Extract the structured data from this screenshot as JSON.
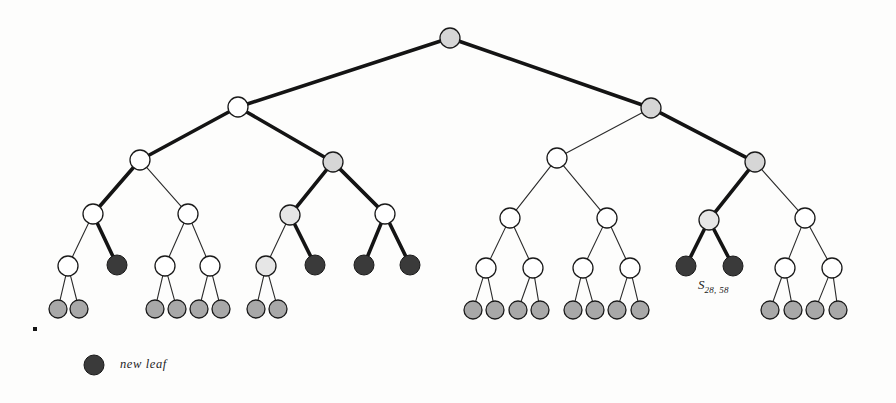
{
  "figure": {
    "background_color": "#fdfdfc",
    "colors": {
      "node_white_fill": "#ffffff",
      "node_gray_fill": "#d6d6d6",
      "node_lightgray_fill": "#e6e6e6",
      "node_dark_fill": "#3a3a3a",
      "node_leaf_fill": "#a8a8a8",
      "stroke": "#1a1a1a",
      "edge_thin": "#2b2b2b",
      "edge_thick": "#141414"
    }
  },
  "labels": {
    "node_label": {
      "base": "S",
      "subscript": "28, 58"
    },
    "legend_label": "new leaf"
  },
  "chart_data": {
    "type": "diagram",
    "diagram_kind": "binary-tree",
    "depth_levels": 6,
    "node_counts_by_level": [
      1,
      2,
      4,
      8,
      16,
      24
    ],
    "legend": [
      {
        "swatch": "dark",
        "label": "new leaf"
      }
    ],
    "annotations": [
      {
        "text": "S_{28, 58}",
        "x": 703,
        "y": 288
      }
    ],
    "nodes": [
      {
        "id": "root",
        "x": 450,
        "y": 38,
        "r": 10,
        "fill": "gray"
      },
      {
        "id": "L1a",
        "x": 238,
        "y": 107,
        "r": 10,
        "fill": "white"
      },
      {
        "id": "L1b",
        "x": 651,
        "y": 108,
        "r": 10,
        "fill": "gray"
      },
      {
        "id": "L2a",
        "x": 140,
        "y": 160,
        "r": 10,
        "fill": "white"
      },
      {
        "id": "L2b",
        "x": 333,
        "y": 162,
        "r": 10,
        "fill": "gray"
      },
      {
        "id": "L2c",
        "x": 557,
        "y": 158,
        "r": 10,
        "fill": "white"
      },
      {
        "id": "L2d",
        "x": 755,
        "y": 162,
        "r": 10,
        "fill": "gray"
      },
      {
        "id": "L3a",
        "x": 93,
        "y": 214,
        "r": 10,
        "fill": "white"
      },
      {
        "id": "L3b",
        "x": 188,
        "y": 214,
        "r": 10,
        "fill": "white"
      },
      {
        "id": "L3c",
        "x": 290,
        "y": 215,
        "r": 10,
        "fill": "lightgray"
      },
      {
        "id": "L3d",
        "x": 385,
        "y": 214,
        "r": 10,
        "fill": "white"
      },
      {
        "id": "L3e",
        "x": 510,
        "y": 218,
        "r": 10,
        "fill": "white"
      },
      {
        "id": "L3f",
        "x": 607,
        "y": 218,
        "r": 10,
        "fill": "white"
      },
      {
        "id": "L3g",
        "x": 709,
        "y": 220,
        "r": 10,
        "fill": "lightgray"
      },
      {
        "id": "L3h",
        "x": 805,
        "y": 218,
        "r": 10,
        "fill": "white"
      },
      {
        "id": "L4a",
        "x": 68,
        "y": 266,
        "r": 10,
        "fill": "white"
      },
      {
        "id": "L4b",
        "x": 117,
        "y": 265,
        "r": 10,
        "fill": "dark"
      },
      {
        "id": "L4c",
        "x": 165,
        "y": 266,
        "r": 10,
        "fill": "white"
      },
      {
        "id": "L4d",
        "x": 210,
        "y": 266,
        "r": 10,
        "fill": "white"
      },
      {
        "id": "L4e",
        "x": 266,
        "y": 266,
        "r": 10,
        "fill": "lightgray"
      },
      {
        "id": "L4f",
        "x": 315,
        "y": 265,
        "r": 10,
        "fill": "dark"
      },
      {
        "id": "L4g",
        "x": 364,
        "y": 265,
        "r": 10,
        "fill": "dark"
      },
      {
        "id": "L4h",
        "x": 410,
        "y": 265,
        "r": 10,
        "fill": "dark"
      },
      {
        "id": "L4i",
        "x": 486,
        "y": 268,
        "r": 10,
        "fill": "white"
      },
      {
        "id": "L4j",
        "x": 533,
        "y": 268,
        "r": 10,
        "fill": "white"
      },
      {
        "id": "L4k",
        "x": 583,
        "y": 268,
        "r": 10,
        "fill": "white"
      },
      {
        "id": "L4l",
        "x": 630,
        "y": 268,
        "r": 10,
        "fill": "white"
      },
      {
        "id": "L4m",
        "x": 686,
        "y": 266,
        "r": 10,
        "fill": "dark"
      },
      {
        "id": "L4n",
        "x": 733,
        "y": 266,
        "r": 10,
        "fill": "dark"
      },
      {
        "id": "L4o",
        "x": 785,
        "y": 268,
        "r": 10,
        "fill": "white"
      },
      {
        "id": "L4p",
        "x": 832,
        "y": 268,
        "r": 10,
        "fill": "white"
      },
      {
        "id": "F01",
        "x": 58,
        "y": 309,
        "r": 9,
        "fill": "leaf"
      },
      {
        "id": "F02",
        "x": 79,
        "y": 309,
        "r": 9,
        "fill": "leaf"
      },
      {
        "id": "F03",
        "x": 155,
        "y": 309,
        "r": 9,
        "fill": "leaf"
      },
      {
        "id": "F04",
        "x": 177,
        "y": 309,
        "r": 9,
        "fill": "leaf"
      },
      {
        "id": "F05",
        "x": 199,
        "y": 309,
        "r": 9,
        "fill": "leaf"
      },
      {
        "id": "F06",
        "x": 221,
        "y": 309,
        "r": 9,
        "fill": "leaf"
      },
      {
        "id": "F07",
        "x": 256,
        "y": 309,
        "r": 9,
        "fill": "leaf"
      },
      {
        "id": "F08",
        "x": 278,
        "y": 309,
        "r": 9,
        "fill": "leaf"
      },
      {
        "id": "F09",
        "x": 473,
        "y": 310,
        "r": 9,
        "fill": "leaf"
      },
      {
        "id": "F10",
        "x": 495,
        "y": 310,
        "r": 9,
        "fill": "leaf"
      },
      {
        "id": "F11",
        "x": 518,
        "y": 310,
        "r": 9,
        "fill": "leaf"
      },
      {
        "id": "F12",
        "x": 540,
        "y": 310,
        "r": 9,
        "fill": "leaf"
      },
      {
        "id": "F13",
        "x": 573,
        "y": 310,
        "r": 9,
        "fill": "leaf"
      },
      {
        "id": "F14",
        "x": 595,
        "y": 310,
        "r": 9,
        "fill": "leaf"
      },
      {
        "id": "F15",
        "x": 617,
        "y": 310,
        "r": 9,
        "fill": "leaf"
      },
      {
        "id": "F16",
        "x": 640,
        "y": 310,
        "r": 9,
        "fill": "leaf"
      },
      {
        "id": "F17",
        "x": 770,
        "y": 310,
        "r": 9,
        "fill": "leaf"
      },
      {
        "id": "F18",
        "x": 793,
        "y": 310,
        "r": 9,
        "fill": "leaf"
      },
      {
        "id": "F19",
        "x": 815,
        "y": 310,
        "r": 9,
        "fill": "leaf"
      },
      {
        "id": "F20",
        "x": 838,
        "y": 310,
        "r": 9,
        "fill": "leaf"
      },
      {
        "id": "LEG",
        "x": 94,
        "y": 365,
        "r": 10,
        "fill": "dark"
      }
    ],
    "edges": [
      {
        "from": "root",
        "to": "L1a",
        "weight": "thick"
      },
      {
        "from": "root",
        "to": "L1b",
        "weight": "thick"
      },
      {
        "from": "L1a",
        "to": "L2a",
        "weight": "thick"
      },
      {
        "from": "L1a",
        "to": "L2b",
        "weight": "thick"
      },
      {
        "from": "L1b",
        "to": "L2c",
        "weight": "thin"
      },
      {
        "from": "L1b",
        "to": "L2d",
        "weight": "thick"
      },
      {
        "from": "L2a",
        "to": "L3a",
        "weight": "thick"
      },
      {
        "from": "L2a",
        "to": "L3b",
        "weight": "thin"
      },
      {
        "from": "L2b",
        "to": "L3c",
        "weight": "thick"
      },
      {
        "from": "L2b",
        "to": "L3d",
        "weight": "thick"
      },
      {
        "from": "L2c",
        "to": "L3e",
        "weight": "thin"
      },
      {
        "from": "L2c",
        "to": "L3f",
        "weight": "thin"
      },
      {
        "from": "L2d",
        "to": "L3g",
        "weight": "thick"
      },
      {
        "from": "L2d",
        "to": "L3h",
        "weight": "thin"
      },
      {
        "from": "L3a",
        "to": "L4a",
        "weight": "thin"
      },
      {
        "from": "L3a",
        "to": "L4b",
        "weight": "thick"
      },
      {
        "from": "L3b",
        "to": "L4c",
        "weight": "thin"
      },
      {
        "from": "L3b",
        "to": "L4d",
        "weight": "thin"
      },
      {
        "from": "L3c",
        "to": "L4e",
        "weight": "thin"
      },
      {
        "from": "L3c",
        "to": "L4f",
        "weight": "thick"
      },
      {
        "from": "L3d",
        "to": "L4g",
        "weight": "thick"
      },
      {
        "from": "L3d",
        "to": "L4h",
        "weight": "thick"
      },
      {
        "from": "L3e",
        "to": "L4i",
        "weight": "thin"
      },
      {
        "from": "L3e",
        "to": "L4j",
        "weight": "thin"
      },
      {
        "from": "L3f",
        "to": "L4k",
        "weight": "thin"
      },
      {
        "from": "L3f",
        "to": "L4l",
        "weight": "thin"
      },
      {
        "from": "L3g",
        "to": "L4m",
        "weight": "thick"
      },
      {
        "from": "L3g",
        "to": "L4n",
        "weight": "thick"
      },
      {
        "from": "L3h",
        "to": "L4o",
        "weight": "thin"
      },
      {
        "from": "L3h",
        "to": "L4p",
        "weight": "thin"
      },
      {
        "from": "L4a",
        "to": "F01",
        "weight": "thin"
      },
      {
        "from": "L4a",
        "to": "F02",
        "weight": "thin"
      },
      {
        "from": "L4c",
        "to": "F03",
        "weight": "thin"
      },
      {
        "from": "L4c",
        "to": "F04",
        "weight": "thin"
      },
      {
        "from": "L4d",
        "to": "F05",
        "weight": "thin"
      },
      {
        "from": "L4d",
        "to": "F06",
        "weight": "thin"
      },
      {
        "from": "L4e",
        "to": "F07",
        "weight": "thin"
      },
      {
        "from": "L4e",
        "to": "F08",
        "weight": "thin"
      },
      {
        "from": "L4i",
        "to": "F09",
        "weight": "thin"
      },
      {
        "from": "L4i",
        "to": "F10",
        "weight": "thin"
      },
      {
        "from": "L4j",
        "to": "F11",
        "weight": "thin"
      },
      {
        "from": "L4j",
        "to": "F12",
        "weight": "thin"
      },
      {
        "from": "L4k",
        "to": "F13",
        "weight": "thin"
      },
      {
        "from": "L4k",
        "to": "F14",
        "weight": "thin"
      },
      {
        "from": "L4l",
        "to": "F15",
        "weight": "thin"
      },
      {
        "from": "L4l",
        "to": "F16",
        "weight": "thin"
      },
      {
        "from": "L4o",
        "to": "F17",
        "weight": "thin"
      },
      {
        "from": "L4o",
        "to": "F18",
        "weight": "thin"
      },
      {
        "from": "L4p",
        "to": "F19",
        "weight": "thin"
      },
      {
        "from": "L4p",
        "to": "F20",
        "weight": "thin"
      }
    ],
    "stray_marks": [
      {
        "x": 33,
        "y": 327,
        "size": 4
      }
    ]
  }
}
